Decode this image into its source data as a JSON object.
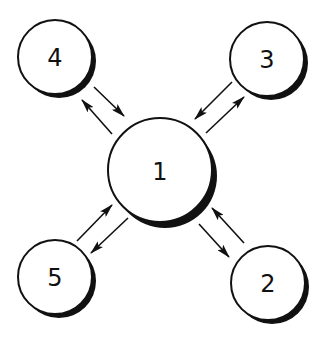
{
  "diagram": {
    "type": "hub-and-spoke",
    "hub": {
      "id": "1",
      "label": "1",
      "cx": 160,
      "cy": 170,
      "r": 52
    },
    "nodes": [
      {
        "id": "4",
        "label": "4",
        "cx": 55,
        "cy": 57,
        "r": 37
      },
      {
        "id": "3",
        "label": "3",
        "cx": 267,
        "cy": 59,
        "r": 37
      },
      {
        "id": "5",
        "label": "5",
        "cx": 55,
        "cy": 277,
        "r": 37
      },
      {
        "id": "2",
        "label": "2",
        "cx": 268,
        "cy": 283,
        "r": 37
      }
    ],
    "edges": [
      {
        "from": "4",
        "to": "1"
      },
      {
        "from": "1",
        "to": "4"
      },
      {
        "from": "3",
        "to": "1"
      },
      {
        "from": "1",
        "to": "3"
      },
      {
        "from": "5",
        "to": "1"
      },
      {
        "from": "1",
        "to": "5"
      },
      {
        "from": "2",
        "to": "1"
      },
      {
        "from": "1",
        "to": "2"
      }
    ],
    "colors": {
      "stroke": "#111111",
      "fill": "#ffffff",
      "shadow": "#111111"
    }
  }
}
